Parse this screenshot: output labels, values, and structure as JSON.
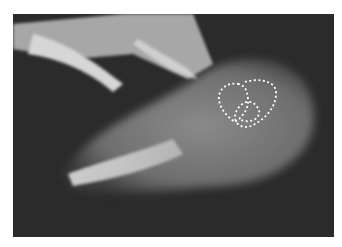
{
  "image": {
    "subject": "radiograph",
    "view": "lateral foot x-ray",
    "annotations": [
      {
        "type": "dashed-outline",
        "label": "region-1",
        "color": "#ffffff"
      },
      {
        "type": "dashed-outline",
        "label": "region-2",
        "color": "#ffffff"
      }
    ],
    "colors": {
      "background": "#2a2a2a",
      "soft_tissue": "#7a7a7a",
      "bone": "#cfcfcf",
      "outline": "#ffffff",
      "border": "#ffffff"
    }
  }
}
